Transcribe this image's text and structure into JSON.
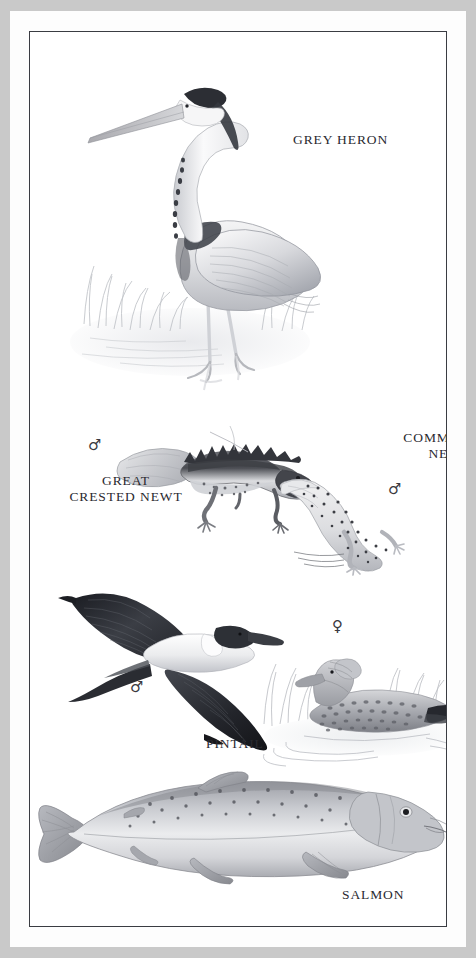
{
  "page": {
    "kind": "field-guide-illustration-plate",
    "background_color": "#c9c9c9",
    "mat_color": "#fdfdfd",
    "frame_line_color": "#3a3c42",
    "plate_color": "#ffffff"
  },
  "labels": {
    "heron": "Grey Heron",
    "common_newt": "Common\nNewt",
    "great_crested_newt": "Great\nCrested Newt",
    "pintail": "Pintail",
    "salmon": "Salmon"
  },
  "symbols": {
    "great_crested_newt_sex": "♂",
    "common_newt_sex": "♂",
    "pintail_male_sex": "♂",
    "pintail_female_sex": "♀"
  },
  "figures": [
    {
      "id": "grey-heron",
      "label": "Grey Heron",
      "sex": null,
      "pose": "standing in shallow water among reeds, long neck curved, head left",
      "position": "top"
    },
    {
      "id": "great-crested-newt",
      "label": "Great Crested Newt",
      "sex": "♂",
      "pose": "crawling left-to-right, dark crested back, pale flank",
      "position": "upper-middle-left"
    },
    {
      "id": "common-newt",
      "label": "Common Newt",
      "sex": "♂",
      "pose": "body curved, spotted pale skin, tail to upper left",
      "position": "upper-middle-right"
    },
    {
      "id": "pintail-male",
      "label": "Pintail",
      "sex": "♂",
      "pose": "in flight, wings spread, long pointed tail, dark head, white neck stripe",
      "position": "middle-left"
    },
    {
      "id": "pintail-female",
      "label": "Pintail",
      "sex": "♀",
      "pose": "swimming on water among reeds, mottled brown plumage, ripples",
      "position": "middle-right"
    },
    {
      "id": "salmon",
      "label": "Salmon",
      "sex": null,
      "pose": "side view facing right, spotted flank, forked tail left",
      "position": "bottom"
    }
  ]
}
